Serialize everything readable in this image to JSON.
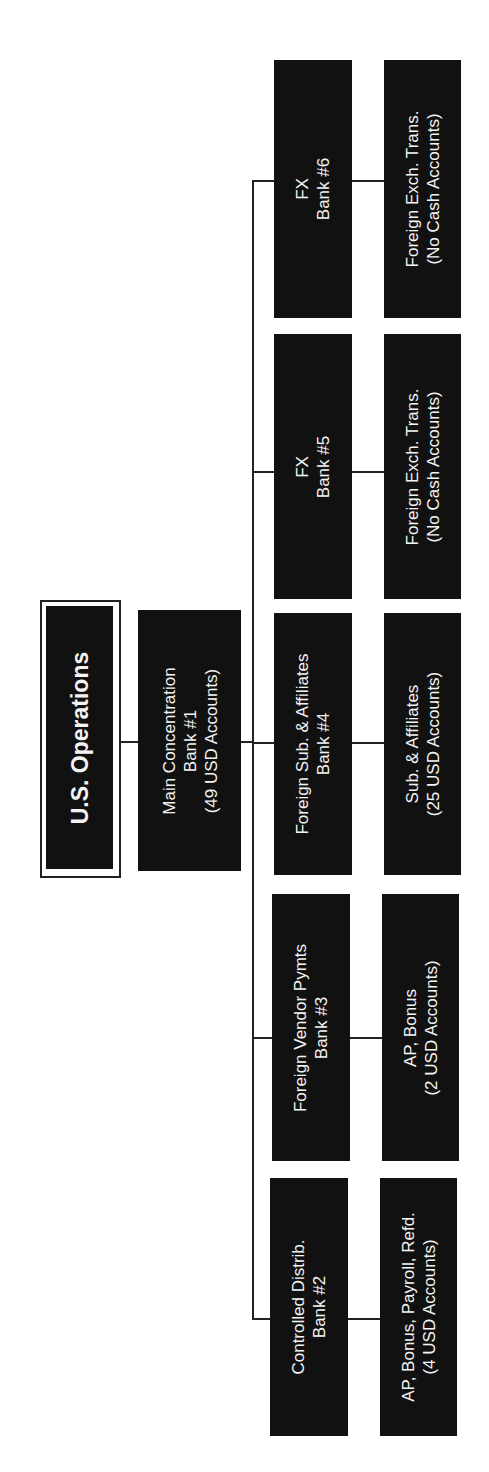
{
  "diagram": {
    "orientation": "rotated-90-ccw",
    "colors": {
      "box_fill": "#111111",
      "box_text": "#f4f4f4",
      "line": "#222222",
      "background": "#ffffff"
    },
    "root": {
      "title": "U.S. Operations"
    },
    "concentration": {
      "lines": [
        "Main Concentration",
        "Bank #1",
        "(49 USD Accounts)"
      ]
    },
    "banks": [
      {
        "id": "bank6",
        "lines": [
          "FX",
          "Bank #6"
        ],
        "detail": [
          "Foreign Exch. Trans.",
          "(No Cash Accounts)"
        ]
      },
      {
        "id": "bank5",
        "lines": [
          "FX",
          "Bank #5"
        ],
        "detail": [
          "Foreign Exch. Trans.",
          "(No Cash Accounts)"
        ]
      },
      {
        "id": "bank4",
        "lines": [
          "Foreign Sub. & Affiliates",
          "Bank #4"
        ],
        "detail": [
          "Sub. & Affiliates",
          "(25 USD Accounts)"
        ]
      },
      {
        "id": "bank3",
        "lines": [
          "Foreign Vendor Pymts",
          "Bank #3"
        ],
        "detail": [
          "AP, Bonus",
          "(2 USD Accounts)"
        ]
      },
      {
        "id": "bank2",
        "lines": [
          "Controlled Distrib.",
          "Bank #2"
        ],
        "detail": [
          "AP, Bonus, Payroll, Refd.",
          "(4 USD Accounts)"
        ]
      }
    ]
  }
}
